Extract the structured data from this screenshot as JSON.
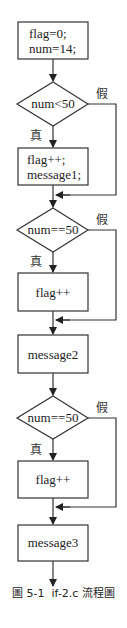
{
  "diagram": {
    "type": "flowchart",
    "caption": "圖 5-1  if-2.c 流程圖",
    "colors": {
      "stroke": "#333333",
      "background": "#ffffff",
      "text": "#222222"
    },
    "nodes": [
      {
        "id": "init",
        "shape": "process",
        "lines": [
          "flag=0;",
          "num=14;"
        ]
      },
      {
        "id": "cond1",
        "shape": "decision",
        "text": "num<50",
        "true_label": "真",
        "false_label": "假"
      },
      {
        "id": "body1",
        "shape": "process",
        "lines": [
          "flag++;",
          "message1;"
        ]
      },
      {
        "id": "cond2",
        "shape": "decision",
        "text": "num==50",
        "true_label": "真",
        "false_label": "假"
      },
      {
        "id": "body2",
        "shape": "process",
        "lines": [
          "flag++"
        ]
      },
      {
        "id": "msg2",
        "shape": "process",
        "lines": [
          "message2"
        ]
      },
      {
        "id": "cond3",
        "shape": "decision",
        "text": "num==50",
        "true_label": "真",
        "false_label": "假"
      },
      {
        "id": "body3",
        "shape": "process",
        "lines": [
          "flag++"
        ]
      },
      {
        "id": "msg3",
        "shape": "process",
        "lines": [
          "message3"
        ]
      }
    ],
    "edges": [
      {
        "from": "init",
        "to": "cond1"
      },
      {
        "from": "cond1",
        "to": "body1",
        "label": "真"
      },
      {
        "from": "cond1",
        "to": "cond2",
        "label": "假"
      },
      {
        "from": "body1",
        "to": "cond2"
      },
      {
        "from": "cond2",
        "to": "body2",
        "label": "真"
      },
      {
        "from": "cond2",
        "to": "msg2",
        "label": "假"
      },
      {
        "from": "body2",
        "to": "msg2"
      },
      {
        "from": "msg2",
        "to": "cond3"
      },
      {
        "from": "cond3",
        "to": "body3",
        "label": "真"
      },
      {
        "from": "cond3",
        "to": "msg3",
        "label": "假"
      },
      {
        "from": "body3",
        "to": "msg3"
      },
      {
        "from": "msg3",
        "to": "end"
      }
    ]
  }
}
